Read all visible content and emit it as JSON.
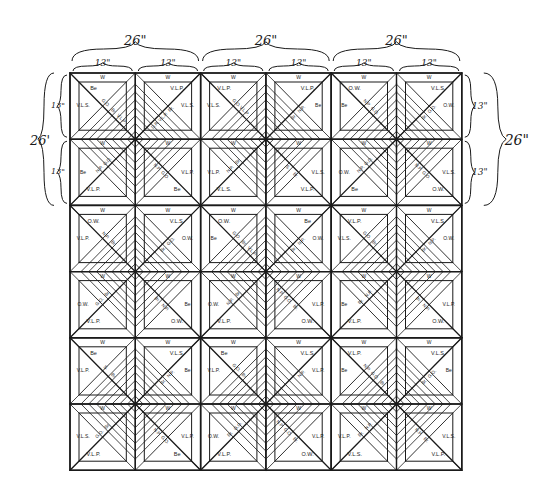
{
  "diagram": {
    "title": "",
    "type": "quilt-pattern-diagram",
    "grid": {
      "rows": 6,
      "cols": 6,
      "block_size_in": 26,
      "cell_size_in": 13
    },
    "dimensions": {
      "top_big": [
        "26\"",
        "26\"",
        "26\""
      ],
      "top_small": [
        "13\"",
        "13\"",
        "13\"",
        "13\"",
        "13\"",
        "13\""
      ],
      "left_big": "26'",
      "left_small": [
        "13\"",
        "13\""
      ],
      "right_big": "26\"",
      "right_small": [
        "13\"",
        "13\""
      ]
    },
    "fabric_legend_codes": [
      "W",
      "Be",
      "V.L.P.",
      "V.L.S.",
      "O.W.",
      "G.O.",
      "N.P.",
      "Br.",
      "S.",
      "D.R."
    ],
    "line_color": "#1a1a1a",
    "background": "#ffffff",
    "cells": [
      [
        {
          "corner": "Be",
          "side": "V.L.S.",
          "border": "W",
          "strips": [
            "G.O.",
            "Br.",
            "V.L.P."
          ],
          "dir": "br"
        },
        {
          "corner": "V.L.P.",
          "side": "V.L.S.",
          "border": "W",
          "strips": [
            "Br.",
            "V.L.P.",
            "D.R."
          ],
          "dir": "bl"
        },
        {
          "corner": "V.L.P.",
          "side": "V.L.S.",
          "border": "W",
          "strips": [
            "G.O.",
            "V.L.P."
          ],
          "dir": "br"
        },
        {
          "corner": "V.L.P.",
          "side": "Be",
          "border": "W",
          "strips": [
            "N.P.",
            "Br."
          ],
          "dir": "bl"
        },
        {
          "corner": "O.W.",
          "side": "Be",
          "border": "W",
          "strips": [
            "N.P.",
            "G.O."
          ],
          "dir": "br"
        },
        {
          "corner": "V.L.S.",
          "side": "O.W.",
          "border": "W",
          "strips": [
            "G.O.",
            "Br."
          ],
          "dir": "bl"
        }
      ],
      [
        {
          "corner": "V.L.P.",
          "side": "Be",
          "border": "W",
          "strips": [
            "N.P.",
            "G.O."
          ],
          "dir": "tr"
        },
        {
          "corner": "Be",
          "side": "V.L.P.",
          "border": "W",
          "strips": [
            "G.O.",
            "N.P."
          ],
          "dir": "tl"
        },
        {
          "corner": "V.L.S.",
          "side": "V.L.P.",
          "border": "W",
          "strips": [
            "N.P.",
            "Br."
          ],
          "dir": "tr"
        },
        {
          "corner": "V.L.P.",
          "side": "V.L.S.",
          "border": "W",
          "strips": [
            "Br.",
            "S."
          ],
          "dir": "tl"
        },
        {
          "corner": "Be",
          "side": "O.W.",
          "border": "W",
          "strips": [
            "N.P.",
            "G.O."
          ],
          "dir": "tr"
        },
        {
          "corner": "O.W.",
          "side": "V.L.S.",
          "border": "W",
          "strips": [
            "G.O.",
            "N.P."
          ],
          "dir": "tl"
        }
      ],
      [
        {
          "corner": "O.W.",
          "side": "V.L.P.",
          "border": "W",
          "strips": [
            "N.P.",
            "Br."
          ],
          "dir": "br"
        },
        {
          "corner": "V.L.S.",
          "side": "O.W.",
          "border": "W",
          "strips": [
            "G.O.",
            "Br."
          ],
          "dir": "bl"
        },
        {
          "corner": "O.W.",
          "side": "Be",
          "border": "W",
          "strips": [
            "G.O.",
            "Br.",
            "V.L.P."
          ],
          "dir": "br"
        },
        {
          "corner": "Be",
          "side": "O.W.",
          "border": "W",
          "strips": [
            "N.P.",
            "Br."
          ],
          "dir": "bl"
        },
        {
          "corner": "V.L.P.",
          "side": "V.L.S.",
          "border": "W",
          "strips": [
            "G.O.",
            "Br."
          ],
          "dir": "br"
        },
        {
          "corner": "V.L.S.",
          "side": "O.W.",
          "border": "W",
          "strips": [
            "N.P.",
            "Br."
          ],
          "dir": "bl"
        }
      ],
      [
        {
          "corner": "V.L.P.",
          "side": "O.W.",
          "border": "W",
          "strips": [
            "G.O.",
            "Br."
          ],
          "dir": "tr"
        },
        {
          "corner": "O.W.",
          "side": "Be",
          "border": "W",
          "strips": [
            "N.P.",
            "Br."
          ],
          "dir": "tl"
        },
        {
          "corner": "V.L.P.",
          "side": "O.W.",
          "border": "W",
          "strips": [
            "N.P.",
            "Br."
          ],
          "dir": "tr"
        },
        {
          "corner": "O.W.",
          "side": "V.L.P.",
          "border": "W",
          "strips": [
            "Br.",
            "G.O.",
            "N.P."
          ],
          "dir": "tl"
        },
        {
          "corner": "V.L.P.",
          "side": "Be",
          "border": "W",
          "strips": [
            "Br.",
            "N.P."
          ],
          "dir": "tr"
        },
        {
          "corner": "O.W.",
          "side": "V.L.P.",
          "border": "W",
          "strips": [
            "N.P.",
            "Br."
          ],
          "dir": "tl"
        }
      ],
      [
        {
          "corner": "Be",
          "side": "V.L.P.",
          "border": "W",
          "strips": [
            "S.",
            "Br."
          ],
          "dir": "br"
        },
        {
          "corner": "V.L.S.",
          "side": "Be",
          "border": "W",
          "strips": [
            "N.P.",
            "Br."
          ],
          "dir": "bl"
        },
        {
          "corner": "Be",
          "side": "V.L.P.",
          "border": "W",
          "strips": [
            "G.O.",
            "Br."
          ],
          "dir": "br"
        },
        {
          "corner": "V.L.S.",
          "side": "V.L.P.",
          "border": "W",
          "strips": [
            "N.P."
          ],
          "dir": "bl"
        },
        {
          "corner": "V.L.P.",
          "side": "Be",
          "border": "W",
          "strips": [
            "N.P.",
            "G.O.",
            "Br."
          ],
          "dir": "br"
        },
        {
          "corner": "V.L.S.",
          "side": "Be",
          "border": "W",
          "strips": [
            "G.O.",
            "Br."
          ],
          "dir": "bl"
        }
      ],
      [
        {
          "corner": "V.L.P.",
          "side": "V.L.S.",
          "border": "W",
          "strips": [
            "G.O.",
            "Br."
          ],
          "dir": "tr"
        },
        {
          "corner": "Be",
          "side": "V.L.P.",
          "border": "W",
          "strips": [
            "G.O.",
            "N.P."
          ],
          "dir": "tl"
        },
        {
          "corner": "V.L.P.",
          "side": "O.W.",
          "border": "W",
          "strips": [
            "Br.",
            "G.O."
          ],
          "dir": "tr"
        },
        {
          "corner": "O.W.",
          "side": "V.L.P.",
          "border": "W",
          "strips": [
            "Br.",
            "G.O.",
            "N.P."
          ],
          "dir": "tl"
        },
        {
          "corner": "V.L.S.",
          "side": "V.L.P.",
          "border": "W",
          "strips": [
            "Br.",
            "N.P."
          ],
          "dir": "tr"
        },
        {
          "corner": "V.L.P.",
          "side": "V.L.S.",
          "border": "W",
          "strips": [
            "Br.",
            "N.P."
          ],
          "dir": "tl"
        }
      ]
    ]
  }
}
